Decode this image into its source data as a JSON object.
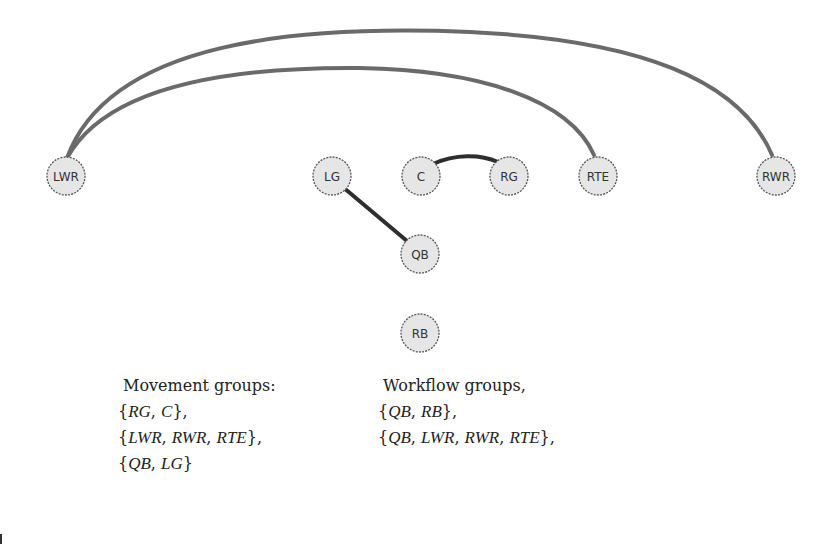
{
  "graph": {
    "nodes": [
      {
        "id": "LWR",
        "label": "LWR"
      },
      {
        "id": "LG",
        "label": "LG"
      },
      {
        "id": "C",
        "label": "C"
      },
      {
        "id": "RG",
        "label": "RG"
      },
      {
        "id": "RTE",
        "label": "RTE"
      },
      {
        "id": "RWR",
        "label": "RWR"
      },
      {
        "id": "QB",
        "label": "QB"
      },
      {
        "id": "RB",
        "label": "RB"
      }
    ],
    "edges": [
      {
        "from": "LWR",
        "to": "RWR",
        "style": "light"
      },
      {
        "from": "LWR",
        "to": "RTE",
        "style": "light"
      },
      {
        "from": "C",
        "to": "RG",
        "style": "dark"
      },
      {
        "from": "LG",
        "to": "QB",
        "style": "dark"
      }
    ]
  },
  "movement": {
    "title": "Movement groups:",
    "sets": [
      {
        "members": [
          "RG",
          "C"
        ],
        "suffix": ","
      },
      {
        "members": [
          "LWR",
          "RWR",
          "RTE"
        ],
        "suffix": ","
      },
      {
        "members": [
          "QB",
          "LG"
        ],
        "suffix": ""
      }
    ]
  },
  "workflow": {
    "title": "Workflow groups,",
    "sets": [
      {
        "members": [
          "QB",
          "RB"
        ],
        "suffix": ","
      },
      {
        "members": [
          "QB",
          "LWR",
          "RWR",
          "RTE"
        ],
        "suffix": ","
      }
    ]
  }
}
